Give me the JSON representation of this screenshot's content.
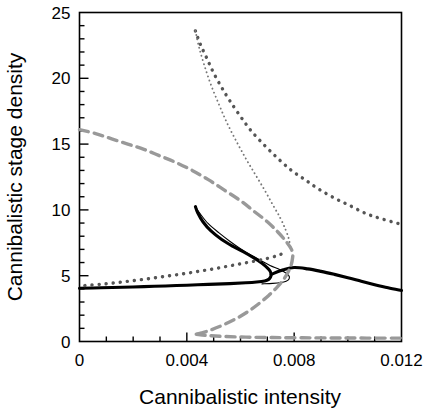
{
  "chart_data": {
    "type": "line",
    "title": "",
    "xlabel": "Cannibalistic intensity",
    "ylabel": "Cannibalistic stage density",
    "xlim": [
      0,
      0.012
    ],
    "ylim": [
      0,
      25
    ],
    "xticks": [
      0,
      0.004,
      0.008,
      0.012
    ],
    "xtick_labels": [
      "0",
      "0.004",
      "0.008",
      "0.012"
    ],
    "yticks": [
      0,
      5,
      10,
      15,
      20,
      25
    ],
    "ytick_labels": [
      "0",
      "5",
      "10",
      "15",
      "20",
      "25"
    ],
    "x_minor_step": 0.001,
    "y_minor_step": 1,
    "grid": false,
    "legend": "none",
    "frame": "box",
    "series": [
      {
        "name": "stable-lower-solid-thick",
        "style": "solid",
        "width": "thick",
        "color": "#000000",
        "points": [
          [
            0.0,
            4.05
          ],
          [
            0.0008,
            4.08
          ],
          [
            0.0016,
            4.12
          ],
          [
            0.0024,
            4.17
          ],
          [
            0.0032,
            4.22
          ],
          [
            0.004,
            4.28
          ],
          [
            0.0048,
            4.34
          ],
          [
            0.0056,
            4.4
          ],
          [
            0.0062,
            4.46
          ],
          [
            0.0066,
            4.52
          ],
          [
            0.0069,
            4.6
          ],
          [
            0.00705,
            4.72
          ],
          [
            0.00712,
            4.9
          ],
          [
            0.00714,
            5.1
          ],
          [
            0.0071,
            5.35
          ],
          [
            0.007,
            5.6
          ],
          [
            0.0068,
            5.95
          ],
          [
            0.0065,
            6.35
          ],
          [
            0.0061,
            6.82
          ],
          [
            0.0057,
            7.25
          ],
          [
            0.0053,
            7.75
          ],
          [
            0.0049,
            8.4
          ],
          [
            0.0046,
            9.1
          ],
          [
            0.0044,
            9.8
          ],
          [
            0.00432,
            10.25
          ]
        ]
      },
      {
        "name": "stable-upper-solid-thick-right",
        "style": "solid",
        "width": "thick",
        "color": "#000000",
        "points": [
          [
            0.00714,
            5.1
          ],
          [
            0.0076,
            5.45
          ],
          [
            0.008,
            5.62
          ],
          [
            0.0085,
            5.52
          ],
          [
            0.009,
            5.33
          ],
          [
            0.0095,
            5.1
          ],
          [
            0.01,
            4.85
          ],
          [
            0.0105,
            4.58
          ],
          [
            0.011,
            4.32
          ],
          [
            0.0115,
            4.08
          ],
          [
            0.012,
            3.88
          ]
        ]
      },
      {
        "name": "unstable-solid-thin",
        "style": "solid",
        "width": "thin",
        "color": "#000000",
        "points": [
          [
            0.00432,
            10.25
          ],
          [
            0.0045,
            9.7
          ],
          [
            0.0048,
            8.95
          ],
          [
            0.0052,
            8.25
          ],
          [
            0.0056,
            7.62
          ],
          [
            0.006,
            7.05
          ],
          [
            0.0064,
            6.55
          ],
          [
            0.0068,
            6.1
          ],
          [
            0.0071,
            5.78
          ],
          [
            0.0074,
            5.52
          ],
          [
            0.0076,
            5.32
          ],
          [
            0.00775,
            5.12
          ],
          [
            0.00782,
            4.92
          ],
          [
            0.0078,
            4.72
          ],
          [
            0.0077,
            4.58
          ],
          [
            0.0075,
            4.48
          ],
          [
            0.0072,
            4.42
          ],
          [
            0.0068,
            4.38
          ]
        ]
      },
      {
        "name": "dotted-thick-upper",
        "style": "dotted",
        "width": "thick",
        "color": "#555555",
        "points": [
          [
            0.00432,
            23.6
          ],
          [
            0.0045,
            22.6
          ],
          [
            0.00475,
            21.5
          ],
          [
            0.005,
            20.4
          ],
          [
            0.0053,
            19.3
          ],
          [
            0.0056,
            18.3
          ],
          [
            0.006,
            17.1
          ],
          [
            0.0064,
            16.0
          ],
          [
            0.0069,
            14.9
          ],
          [
            0.0074,
            13.9
          ],
          [
            0.0079,
            13.0
          ],
          [
            0.0084,
            12.3
          ],
          [
            0.0089,
            11.6
          ],
          [
            0.0095,
            10.9
          ],
          [
            0.0101,
            10.3
          ],
          [
            0.0107,
            9.7
          ],
          [
            0.0113,
            9.3
          ],
          [
            0.012,
            8.9
          ]
        ]
      },
      {
        "name": "dotted-thin-upper",
        "style": "dotted",
        "width": "thin",
        "color": "#777777",
        "points": [
          [
            0.00432,
            23.6
          ],
          [
            0.00445,
            22.4
          ],
          [
            0.00465,
            21.0
          ],
          [
            0.0049,
            19.5
          ],
          [
            0.0052,
            18.0
          ],
          [
            0.0055,
            16.6
          ],
          [
            0.00585,
            15.2
          ],
          [
            0.0062,
            13.9
          ],
          [
            0.00655,
            12.7
          ],
          [
            0.0069,
            11.5
          ],
          [
            0.0072,
            10.4
          ],
          [
            0.00748,
            9.4
          ],
          [
            0.00768,
            8.5
          ],
          [
            0.0078,
            7.8
          ],
          [
            0.00786,
            7.2
          ]
        ]
      },
      {
        "name": "dotted-thick-lower",
        "style": "dotted",
        "width": "thick",
        "color": "#555555",
        "points": [
          [
            0.0002,
            4.25
          ],
          [
            0.0008,
            4.35
          ],
          [
            0.0014,
            4.48
          ],
          [
            0.002,
            4.62
          ],
          [
            0.0026,
            4.78
          ],
          [
            0.0032,
            4.95
          ],
          [
            0.0038,
            5.12
          ],
          [
            0.0044,
            5.32
          ],
          [
            0.005,
            5.52
          ],
          [
            0.0056,
            5.75
          ],
          [
            0.0062,
            5.98
          ],
          [
            0.0068,
            6.22
          ],
          [
            0.0072,
            6.42
          ],
          [
            0.0075,
            6.62
          ],
          [
            0.0077,
            6.85
          ]
        ]
      },
      {
        "name": "dashed-gray-upper",
        "style": "dashed",
        "width": "thick",
        "color": "#999999",
        "points": [
          [
            0.0,
            16.1
          ],
          [
            0.0006,
            15.8
          ],
          [
            0.0012,
            15.4
          ],
          [
            0.0018,
            15.0
          ],
          [
            0.0024,
            14.6
          ],
          [
            0.003,
            14.1
          ],
          [
            0.0036,
            13.6
          ],
          [
            0.0042,
            13.0
          ],
          [
            0.0048,
            12.3
          ],
          [
            0.0054,
            11.5
          ],
          [
            0.006,
            10.7
          ],
          [
            0.0065,
            9.9
          ],
          [
            0.007,
            9.1
          ],
          [
            0.0074,
            8.3
          ],
          [
            0.0077,
            7.6
          ],
          [
            0.0079,
            7.0
          ],
          [
            0.00795,
            6.5
          ]
        ]
      },
      {
        "name": "dashed-gray-middle-unstable",
        "style": "dashed",
        "width": "thick",
        "color": "#999999",
        "points": [
          [
            0.00795,
            6.5
          ],
          [
            0.0079,
            5.9
          ],
          [
            0.00778,
            5.3
          ],
          [
            0.0076,
            4.7
          ],
          [
            0.00735,
            4.1
          ],
          [
            0.00705,
            3.5
          ],
          [
            0.0067,
            2.9
          ],
          [
            0.0063,
            2.3
          ],
          [
            0.00585,
            1.75
          ],
          [
            0.00535,
            1.25
          ],
          [
            0.0049,
            0.88
          ],
          [
            0.00455,
            0.65
          ],
          [
            0.00435,
            0.55
          ]
        ]
      },
      {
        "name": "dashed-gray-lower-stable",
        "style": "dashed",
        "width": "thick",
        "color": "#999999",
        "points": [
          [
            0.00435,
            0.55
          ],
          [
            0.0048,
            0.45
          ],
          [
            0.0054,
            0.38
          ],
          [
            0.0062,
            0.33
          ],
          [
            0.0072,
            0.3
          ],
          [
            0.0083,
            0.28
          ],
          [
            0.0095,
            0.27
          ],
          [
            0.0107,
            0.26
          ],
          [
            0.012,
            0.26
          ]
        ]
      }
    ]
  },
  "axes": {
    "xlabel": "Cannibalistic intensity",
    "ylabel": "Cannibalistic stage density",
    "xtick_labels": [
      "0",
      "0.004",
      "0.008",
      "0.012"
    ],
    "ytick_labels": [
      "0",
      "5",
      "10",
      "15",
      "20",
      "25"
    ]
  },
  "colors": {
    "frame": "#000000",
    "solid_curve": "#000000",
    "dotted_curve": "#555555",
    "dashed_curve": "#999999",
    "background": "#ffffff"
  }
}
